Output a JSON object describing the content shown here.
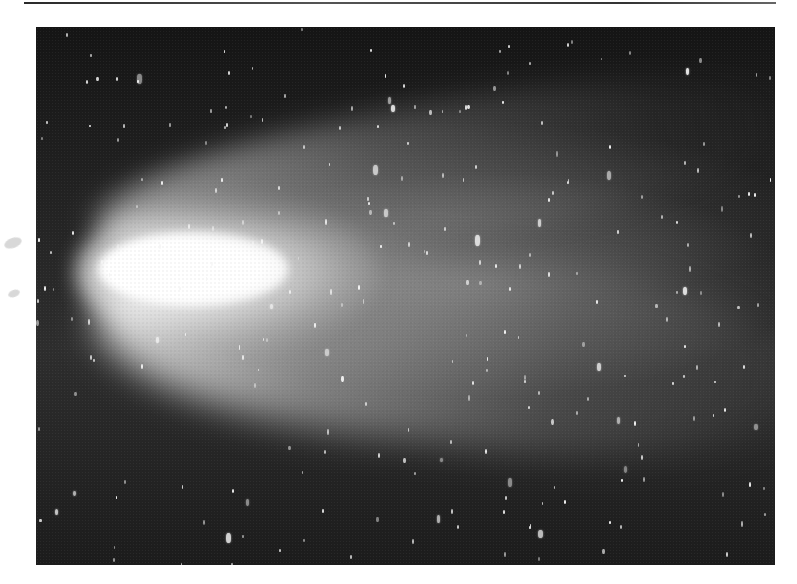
{
  "image": {
    "subject": "comet in night sky",
    "description": "Black-and-white photograph of a bright comet with a broad, fan-shaped tail extending to the right against a star field",
    "colors": {
      "page_background": "#ffffff",
      "sky": "#141414",
      "coma": "#ffffff",
      "tail": "#9a9a9a",
      "stars": "#f4f4f4"
    },
    "frame": {
      "x": 36,
      "y": 27,
      "width": 739,
      "height": 538
    },
    "comet_head": {
      "x": 100,
      "y": 265
    },
    "tail_direction": "right",
    "star_count_rendered": 260
  }
}
